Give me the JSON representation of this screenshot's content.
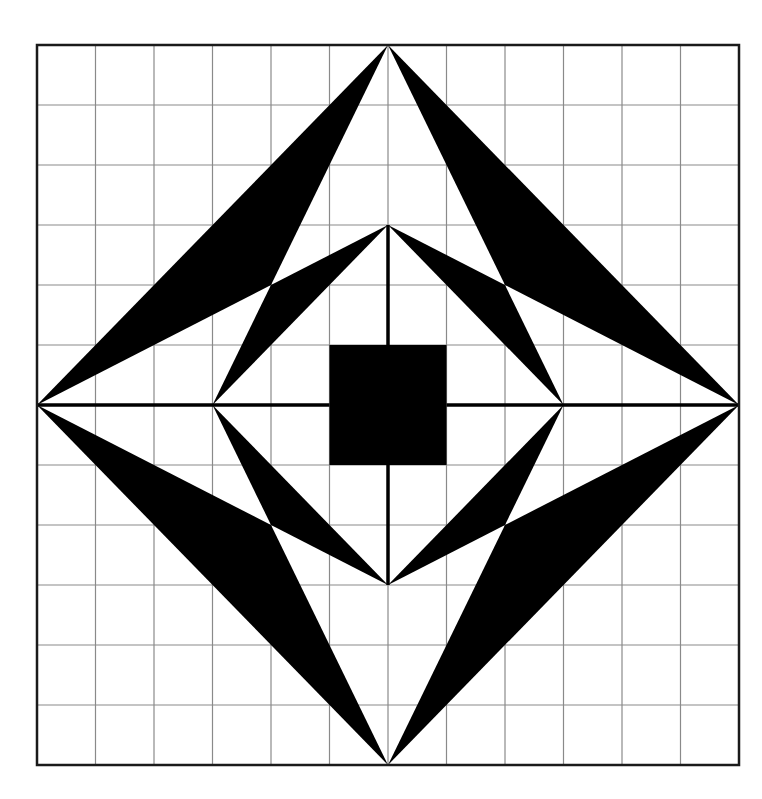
{
  "figure": {
    "type": "geometric-pattern-on-grid",
    "grid": {
      "columns": 12,
      "rows": 12
    },
    "frame_px": {
      "left": 37,
      "top": 45,
      "right": 739,
      "bottom": 765
    },
    "colors": {
      "fill": "#000000",
      "grid_line": "#8a8a8a",
      "frame": "#1a1a1a",
      "background": "#ffffff"
    },
    "outer_diamond": [
      [
        6,
        0
      ],
      [
        12,
        6
      ],
      [
        6,
        12
      ],
      [
        0,
        6
      ]
    ],
    "inner_diamond": [
      [
        6,
        3
      ],
      [
        9,
        6
      ],
      [
        6,
        9
      ],
      [
        3,
        6
      ]
    ],
    "center_square": {
      "x": 5,
      "y": 5,
      "size": 2
    },
    "axes_lines": [
      [
        [
          0,
          6
        ],
        [
          5,
          6
        ]
      ],
      [
        [
          7,
          6
        ],
        [
          12,
          6
        ]
      ],
      [
        [
          6,
          3
        ],
        [
          6,
          5
        ]
      ],
      [
        [
          6,
          7
        ],
        [
          6,
          9
        ]
      ]
    ],
    "black_triangles": [
      [
        [
          6,
          0
        ],
        [
          0,
          6
        ],
        [
          4,
          4
        ]
      ],
      [
        [
          6,
          3
        ],
        [
          3,
          6
        ],
        [
          4,
          4
        ]
      ],
      [
        [
          6,
          0
        ],
        [
          12,
          6
        ],
        [
          8,
          4
        ]
      ],
      [
        [
          6,
          3
        ],
        [
          9,
          6
        ],
        [
          8,
          4
        ]
      ],
      [
        [
          0,
          6
        ],
        [
          6,
          12
        ],
        [
          4,
          8
        ]
      ],
      [
        [
          3,
          6
        ],
        [
          6,
          9
        ],
        [
          4,
          8
        ]
      ],
      [
        [
          12,
          6
        ],
        [
          6,
          12
        ],
        [
          8,
          8
        ]
      ],
      [
        [
          9,
          6
        ],
        [
          6,
          9
        ],
        [
          8,
          8
        ]
      ]
    ]
  }
}
